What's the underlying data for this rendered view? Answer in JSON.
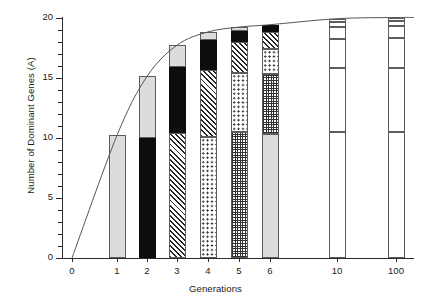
{
  "chart_data": {
    "type": "bar",
    "title": "",
    "xlabel": "Generations",
    "ylabel": "Number of Dominant Genes (A)",
    "categories": [
      "0",
      "1",
      "2",
      "3",
      "4",
      "5",
      "6",
      "10",
      "100"
    ],
    "ytick_labels": [
      "0",
      "5",
      "10",
      "15",
      "20"
    ],
    "ytick_values": [
      0,
      5,
      10,
      15,
      20
    ],
    "ylim": [
      0,
      20
    ],
    "grid": false,
    "legend": null,
    "stacked": true,
    "segment_fills": [
      "white",
      "light-gray",
      "black",
      "diagonal-hatch",
      "dots",
      "checker"
    ],
    "bars": [
      {
        "category": "0",
        "total": 0,
        "segments": []
      },
      {
        "category": "1",
        "total": 10.2,
        "segments": [
          {
            "fill": "light-gray",
            "from": 0,
            "to": 10.2
          }
        ]
      },
      {
        "category": "2",
        "total": 15.1,
        "segments": [
          {
            "fill": "black",
            "from": 0,
            "to": 10.0
          },
          {
            "fill": "light-gray",
            "from": 10.0,
            "to": 15.1
          }
        ]
      },
      {
        "category": "3",
        "total": 17.7,
        "segments": [
          {
            "fill": "diagonal-hatch",
            "from": 0,
            "to": 10.4
          },
          {
            "fill": "black",
            "from": 10.4,
            "to": 15.9
          },
          {
            "fill": "light-gray",
            "from": 15.9,
            "to": 17.7
          }
        ]
      },
      {
        "category": "4",
        "total": 18.8,
        "segments": [
          {
            "fill": "dots",
            "from": 0,
            "to": 10.1
          },
          {
            "fill": "diagonal-hatch",
            "from": 10.1,
            "to": 15.6
          },
          {
            "fill": "black",
            "from": 15.6,
            "to": 18.1
          },
          {
            "fill": "light-gray",
            "from": 18.1,
            "to": 18.8
          }
        ]
      },
      {
        "category": "5",
        "total": 19.2,
        "segments": [
          {
            "fill": "checker",
            "from": 0,
            "to": 10.5
          },
          {
            "fill": "dots",
            "from": 10.5,
            "to": 15.4
          },
          {
            "fill": "diagonal-hatch",
            "from": 15.4,
            "to": 18.0
          },
          {
            "fill": "black",
            "from": 18.0,
            "to": 18.9
          },
          {
            "fill": "light-gray",
            "from": 18.9,
            "to": 19.2
          }
        ]
      },
      {
        "category": "6",
        "total": 19.4,
        "segments": [
          {
            "fill": "light-gray",
            "from": 0,
            "to": 10.3
          },
          {
            "fill": "checker",
            "from": 10.3,
            "to": 15.3
          },
          {
            "fill": "dots",
            "from": 15.3,
            "to": 17.4
          },
          {
            "fill": "diagonal-hatch",
            "from": 17.4,
            "to": 18.8
          },
          {
            "fill": "black",
            "from": 18.8,
            "to": 19.4
          }
        ]
      },
      {
        "category": "10",
        "total": 19.9,
        "segments": [
          {
            "fill": "white",
            "from": 0,
            "to": 10.5
          },
          {
            "fill": "white",
            "from": 10.5,
            "to": 15.8
          },
          {
            "fill": "white",
            "from": 15.8,
            "to": 18.2
          },
          {
            "fill": "white",
            "from": 18.2,
            "to": 19.2
          },
          {
            "fill": "white",
            "from": 19.2,
            "to": 19.6
          },
          {
            "fill": "white",
            "from": 19.6,
            "to": 19.9
          }
        ]
      },
      {
        "category": "100",
        "total": 20.0,
        "segments": [
          {
            "fill": "white",
            "from": 0,
            "to": 10.5
          },
          {
            "fill": "white",
            "from": 10.5,
            "to": 15.8
          },
          {
            "fill": "white",
            "from": 15.8,
            "to": 18.3
          },
          {
            "fill": "white",
            "from": 18.3,
            "to": 19.3
          },
          {
            "fill": "white",
            "from": 19.3,
            "to": 19.7
          },
          {
            "fill": "white",
            "from": 19.7,
            "to": 20.0
          }
        ]
      }
    ],
    "curve": {
      "name": "cumulative-response-curve",
      "points": [
        {
          "x": 0,
          "y": 0
        },
        {
          "x": 1,
          "y": 10.2
        },
        {
          "x": 2,
          "y": 15.1
        },
        {
          "x": 3,
          "y": 17.7
        },
        {
          "x": 4,
          "y": 18.8
        },
        {
          "x": 5,
          "y": 19.2
        },
        {
          "x": 6,
          "y": 19.4
        },
        {
          "x": 10,
          "y": 19.9
        },
        {
          "x": 100,
          "y": 20.0
        }
      ]
    }
  }
}
